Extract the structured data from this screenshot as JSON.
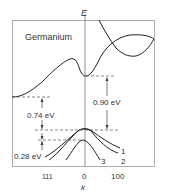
{
  "diagram": {
    "title": "Germanium",
    "y_axis_label": "E",
    "x_axis_label": "k",
    "x_ticks": [
      "111",
      "0",
      "100"
    ],
    "energy_gaps": [
      {
        "label": "0.74 eV",
        "description": "indirect gap: valence band maximum to conduction band minimum along 111"
      },
      {
        "label": "0.90 eV",
        "description": "direct gap at k=0"
      },
      {
        "label": "0.28 eV",
        "description": "spin-orbit split-off energy"
      }
    ],
    "valence_bands": [
      {
        "label": "1"
      },
      {
        "label": "2"
      },
      {
        "label": "3"
      }
    ],
    "colors": {
      "line": "#222222",
      "dashed": "#555555",
      "text": "#333333",
      "frame": "#888888"
    }
  }
}
